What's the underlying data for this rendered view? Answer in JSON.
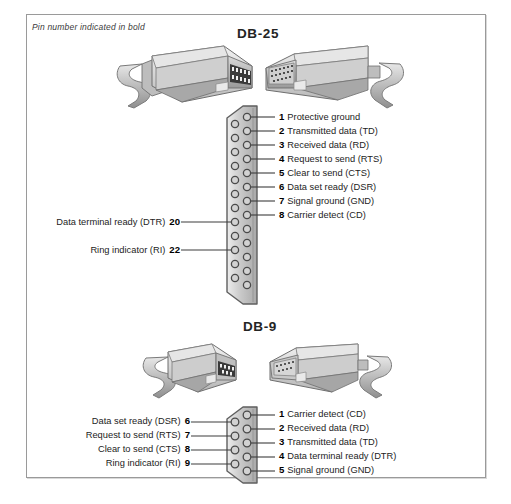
{
  "panel": {
    "caption": "Pin number indicated in bold",
    "border_color": "#9a9a9a",
    "background": "#ffffff"
  },
  "diagrams": [
    {
      "title": "DB-25",
      "connector_type": "DB-25",
      "total_pins": 25,
      "right_pins": [
        {
          "number": "1",
          "label": "Protective ground"
        },
        {
          "number": "2",
          "label": "Transmitted data (TD)"
        },
        {
          "number": "3",
          "label": "Received data (RD)"
        },
        {
          "number": "4",
          "label": "Request to send (RTS)"
        },
        {
          "number": "5",
          "label": "Clear to send (CTS)"
        },
        {
          "number": "6",
          "label": "Data set ready (DSR)"
        },
        {
          "number": "7",
          "label": "Signal ground (GND)"
        },
        {
          "number": "8",
          "label": "Carrier detect (CD)"
        }
      ],
      "left_pins": [
        {
          "number": "20",
          "label": "Data terminal ready (DTR)"
        },
        {
          "number": "22",
          "label": "Ring indicator (RI)"
        }
      ]
    },
    {
      "title": "DB-9",
      "connector_type": "DB-9",
      "total_pins": 9,
      "right_pins": [
        {
          "number": "1",
          "label": "Carrier detect (CD)"
        },
        {
          "number": "2",
          "label": "Received data (RD)"
        },
        {
          "number": "3",
          "label": "Transmitted data (TD)"
        },
        {
          "number": "4",
          "label": "Data terminal ready (DTR)"
        },
        {
          "number": "5",
          "label": "Signal ground (GND)"
        }
      ],
      "left_pins": [
        {
          "number": "6",
          "label": "Data set ready (DSR)"
        },
        {
          "number": "7",
          "label": "Request to send (RTS)"
        },
        {
          "number": "8",
          "label": "Clear to send (CTS)"
        },
        {
          "number": "9",
          "label": "Ring indicator (RI)"
        }
      ]
    }
  ],
  "illustrations": [
    {
      "name": "db25-male-connector-with-cable"
    },
    {
      "name": "db25-female-connector-with-cable"
    },
    {
      "name": "db9-male-connector-with-cable"
    },
    {
      "name": "db9-female-connector-with-cable"
    }
  ]
}
